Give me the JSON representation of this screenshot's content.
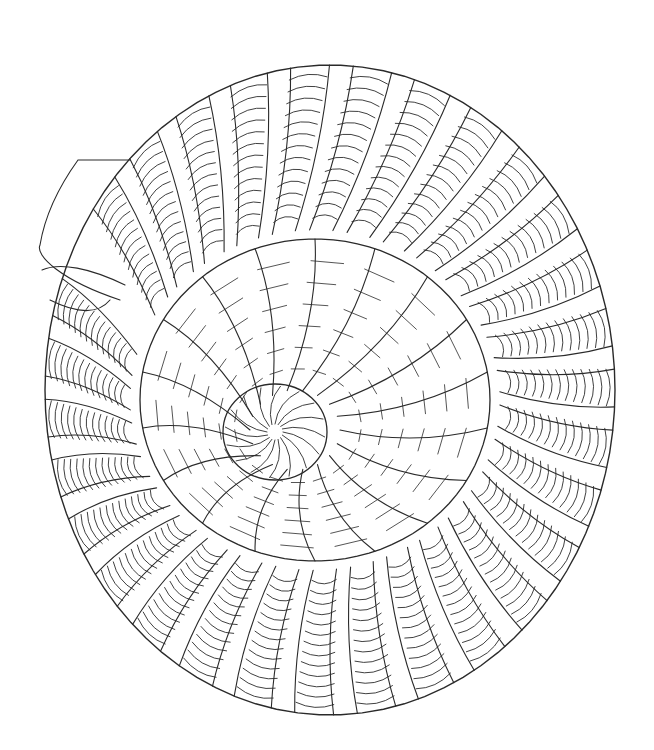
{
  "image": {
    "subject": "spiral-shell-line-art",
    "width": 654,
    "height": 750,
    "background": "#ffffff",
    "stroke_color": "#2a2a2a"
  },
  "shell": {
    "center": [
      295,
      430
    ],
    "outer_ribs": 30,
    "inner_ribs": 18,
    "hatch_lines_per_rib": 14
  }
}
